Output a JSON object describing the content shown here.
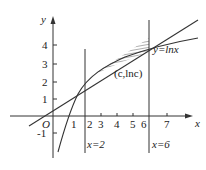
{
  "figure": {
    "axis_labels": {
      "x": "x",
      "y": "y",
      "origin": "O"
    },
    "x_ticks": [
      "1",
      "2",
      "3",
      "4",
      "5",
      "6",
      "7"
    ],
    "y_ticks": [
      "4",
      "3",
      "2",
      "1",
      "-1"
    ],
    "curve_label": "y=lnx",
    "point_label": "(c,lnc)",
    "vline_left_label": "x=2",
    "vline_right_label": "x=6",
    "colors": {
      "stroke": "#333333",
      "fill": "#ffffff"
    }
  }
}
